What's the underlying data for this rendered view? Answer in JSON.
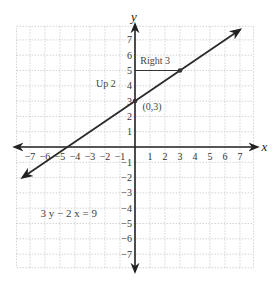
{
  "chart_data": {
    "type": "line",
    "title": "",
    "xlabel": "x",
    "ylabel": "y",
    "xlim": [
      -7.5,
      7.5
    ],
    "ylim": [
      -7.5,
      7.5
    ],
    "grid": true,
    "x_ticks": [
      -7,
      -6,
      -5,
      -4,
      -3,
      -2,
      -1,
      1,
      2,
      3,
      4,
      5,
      6,
      7
    ],
    "y_ticks": [
      -7,
      -6,
      -5,
      -4,
      -3,
      -2,
      -1,
      1,
      2,
      3,
      4,
      5,
      6,
      7
    ],
    "x_tick_labels": [
      "−7",
      "−6",
      "−5",
      "−4",
      "−3",
      "−2",
      "−1",
      "1",
      "2",
      "3",
      "4",
      "5",
      "6",
      "7"
    ],
    "y_tick_labels": [
      "−7",
      "−6",
      "−5",
      "−4",
      "−3",
      "−2",
      "−1",
      "1",
      "2",
      "3",
      "4",
      "5",
      "6",
      "7"
    ],
    "series": [
      {
        "name": "3y − 2x = 9",
        "slope": 0.6667,
        "intercept": 3,
        "x": [
          -7.5,
          7.0
        ],
        "y": [
          -2.0,
          7.67
        ],
        "arrows": "both"
      }
    ],
    "points": [
      {
        "x": 0,
        "y": 3,
        "label": "(0,3)"
      },
      {
        "x": 3,
        "y": 5,
        "label": ""
      }
    ],
    "annotations": [
      {
        "text": "Right 3",
        "from": [
          0,
          5
        ],
        "to": [
          3,
          5
        ]
      },
      {
        "text": "Up 2",
        "near": [
          -2,
          4
        ]
      },
      {
        "text": "(0,3)",
        "near": [
          0,
          3
        ]
      }
    ],
    "equation_label": "3 y − 2 x = 9"
  }
}
